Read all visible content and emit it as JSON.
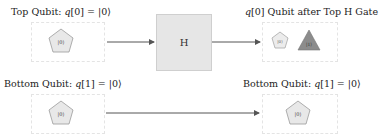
{
  "diagram": {
    "top_row": {
      "input_label": "Top Qubit: q[0] = |0⟩",
      "input_label_parts": {
        "prefix": "Top Qubit: ",
        "var": "q",
        "idx": "[0]",
        "eq": " = |0⟩"
      },
      "input_state": "|0⟩",
      "gate_label": "H",
      "output_label": "q[0] Qubit after Top H Gate",
      "output_label_parts": {
        "var": "q",
        "rest": "[0] Qubit after Top H Gate"
      },
      "output_states": [
        {
          "shape": "pentagon",
          "ket": "|0⟩",
          "color": "#e6e6e6"
        },
        {
          "shape": "triangle",
          "ket": "|1⟩",
          "color": "#8c8c8c"
        }
      ]
    },
    "bottom_row": {
      "input_label": "Bottom Qubit: q[1] = |0⟩",
      "input_label_parts": {
        "prefix": "Bottom Qubit: ",
        "var": "q",
        "idx": "[1]",
        "eq": " = |0⟩"
      },
      "input_state": "|0⟩",
      "output_label": "Bottom Qubit: q[1] = |0⟩",
      "output_label_parts": {
        "prefix": "Bottom Qubit: ",
        "var": "q",
        "idx": "[1]",
        "eq": " = |0⟩"
      },
      "output_state": "|0⟩"
    },
    "colors": {
      "pentagon_fill": "#e8e8e8",
      "pentagon_stroke": "#9a9a9a",
      "triangle_fill": "#8c8c8c",
      "gate_fill": "#e6e6e6",
      "wire": "#555555"
    }
  }
}
